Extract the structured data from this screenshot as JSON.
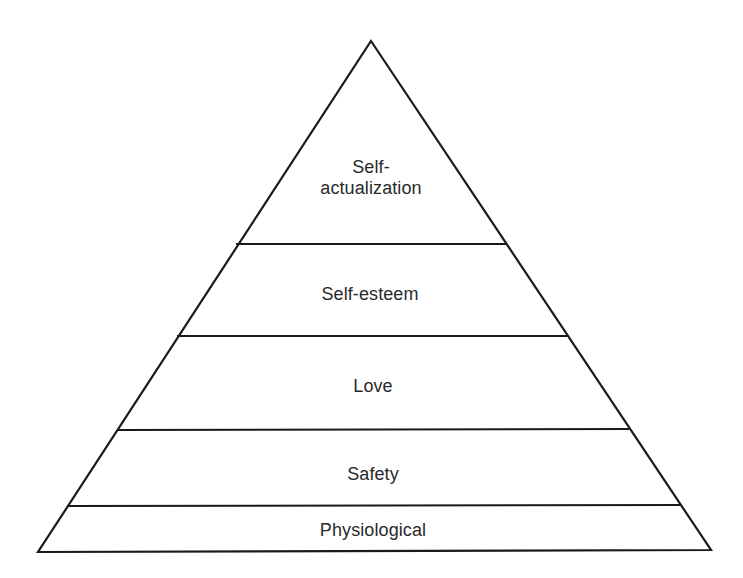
{
  "diagram": {
    "type": "pyramid",
    "colors": {
      "stroke": "#1a1a1a",
      "fill": "#ffffff",
      "text": "#2a2a2a"
    },
    "levels": [
      {
        "label_line1": "Self-",
        "label_line2": "actualization",
        "order": 5
      },
      {
        "label": "Self-esteem",
        "order": 4
      },
      {
        "label": "Love",
        "order": 3
      },
      {
        "label": "Safety",
        "order": 2
      },
      {
        "label": "Physiological",
        "order": 1
      }
    ]
  }
}
